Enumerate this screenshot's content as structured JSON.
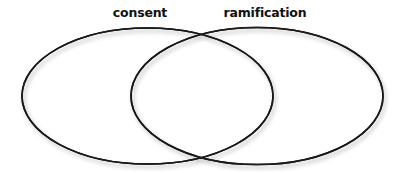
{
  "diagram": {
    "type": "venn",
    "sets": [
      {
        "label": "consent",
        "label_x": 140,
        "cx": 147.5,
        "cy": 96,
        "rx": 125.5,
        "ry": 68
      },
      {
        "label": "ramification",
        "label_x": 265,
        "cx": 257,
        "cy": 96,
        "rx": 126,
        "ry": 68.5
      }
    ],
    "stroke_color": "#1a1a1a",
    "fill_color": "#ffffff",
    "shadow_color": "#9a9a9a"
  }
}
